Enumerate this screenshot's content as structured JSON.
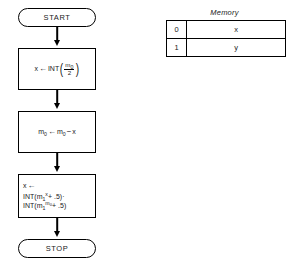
{
  "flowchart": {
    "start": {
      "label": "START"
    },
    "stop": {
      "label": "STOP"
    },
    "steps": [
      {
        "id": "compute-x",
        "target": "x",
        "assign_glyph": "←",
        "function": "INT",
        "numerator": "m",
        "numerator_sub": "0",
        "denominator": "2",
        "text": "x ← INT(m₀/2)"
      },
      {
        "id": "update-m0",
        "lhs_base": "m",
        "lhs_sub": "0",
        "assign_glyph": "←",
        "rhs_base": "m",
        "rhs_sub": "0",
        "minus": "−",
        "rhs_var": "x",
        "text": "m₀ ← m₀ − x"
      },
      {
        "id": "compute-x-power",
        "line1_target": "x",
        "line1_glyph": "←",
        "line2_fn": "INT",
        "line2_base": "m",
        "line2_sub": "1",
        "line2_sup": "x",
        "line2_tail": "+ .5)·",
        "line3_fn": "INT",
        "line3_base": "m",
        "line3_sub": "1",
        "line3_sup_base": "m",
        "line3_sup_sub": "0",
        "line3_tail": "+ .5)",
        "text": "x ← INT(m₁ˣ + .5)·INT(m₁^m₀ + .5)"
      }
    ]
  },
  "memory": {
    "title": "Memory",
    "columns": [
      "address",
      "value"
    ],
    "rows": [
      {
        "address": "0",
        "value": "x"
      },
      {
        "address": "1",
        "value": "y"
      }
    ]
  },
  "colors": {
    "ink": "#000000",
    "background": "#ffffff"
  }
}
